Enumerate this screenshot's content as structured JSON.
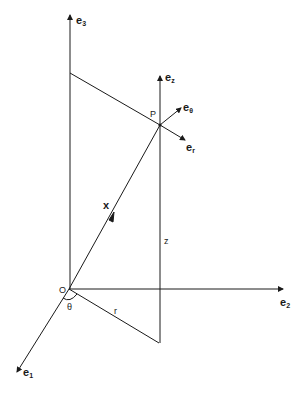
{
  "diagram": {
    "labels": {
      "e3": {
        "base": "e",
        "sub": "3"
      },
      "e2": {
        "base": "e",
        "sub": "2"
      },
      "e1": {
        "base": "e",
        "sub": "1"
      },
      "ez": {
        "base": "e",
        "sub": "z"
      },
      "etheta": {
        "base": "e",
        "sub": "θ"
      },
      "er": {
        "base": "e",
        "sub": "r"
      },
      "point": "P",
      "origin": "O",
      "vector": "x",
      "theta": "θ",
      "r": "r",
      "z": "z"
    },
    "colors": {
      "line": "#1a1a1a",
      "background": "#ffffff"
    }
  }
}
